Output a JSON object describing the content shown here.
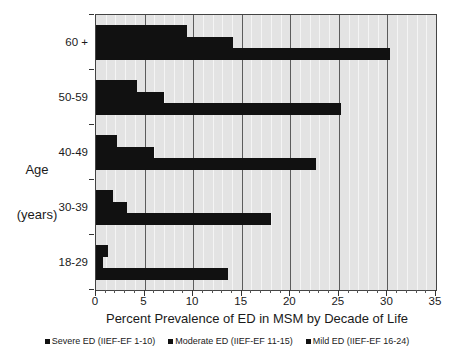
{
  "chart_data": {
    "type": "bar",
    "orientation": "horizontal",
    "title": "",
    "xlabel": "Percent Prevalence of ED in MSM by Decade of Life",
    "ylabel": "Age\n(years)",
    "ylabel_line1": "Age",
    "ylabel_line2": "(years)",
    "categories": [
      "18-29",
      "30-39",
      "40-49",
      "50-59",
      "60 +"
    ],
    "series": [
      {
        "name": "Severe ED (IIEF-EF 1-10)",
        "color": "#111111",
        "values": [
          1.2,
          1.7,
          2.2,
          4.2,
          9.4
        ]
      },
      {
        "name": "Moderate ED (IIEF-EF 11-15)",
        "color": "#111111",
        "values": [
          0.7,
          3.2,
          6.0,
          7.0,
          14.1
        ]
      },
      {
        "name": "Mild ED (IIEF-EF 16-24)",
        "color": "#111111",
        "values": [
          13.6,
          18.0,
          22.6,
          25.2,
          30.3
        ]
      }
    ],
    "xlim": [
      0,
      35
    ],
    "xticks": [
      0,
      5,
      10,
      15,
      20,
      25,
      30,
      35
    ],
    "xtick_labels": [
      "0",
      "5",
      "10",
      "15",
      "20",
      "25",
      "30",
      "35"
    ],
    "x_minor_tick_step": 1,
    "grid": true,
    "grid_axis": "x",
    "legend_position": "bottom",
    "plot_background": "#e3e3e3",
    "major_gridline_color": "#5c5c5c",
    "minor_gridline_color": "#f4f4f4",
    "frame_color": "#444444"
  },
  "legend": {
    "entries": [
      {
        "label": "Severe ED (IIEF-EF 1-10)"
      },
      {
        "label": "Moderate ED (IIEF-EF 11-15)"
      },
      {
        "label": "Mild ED (IIEF-EF 16-24)"
      }
    ]
  }
}
